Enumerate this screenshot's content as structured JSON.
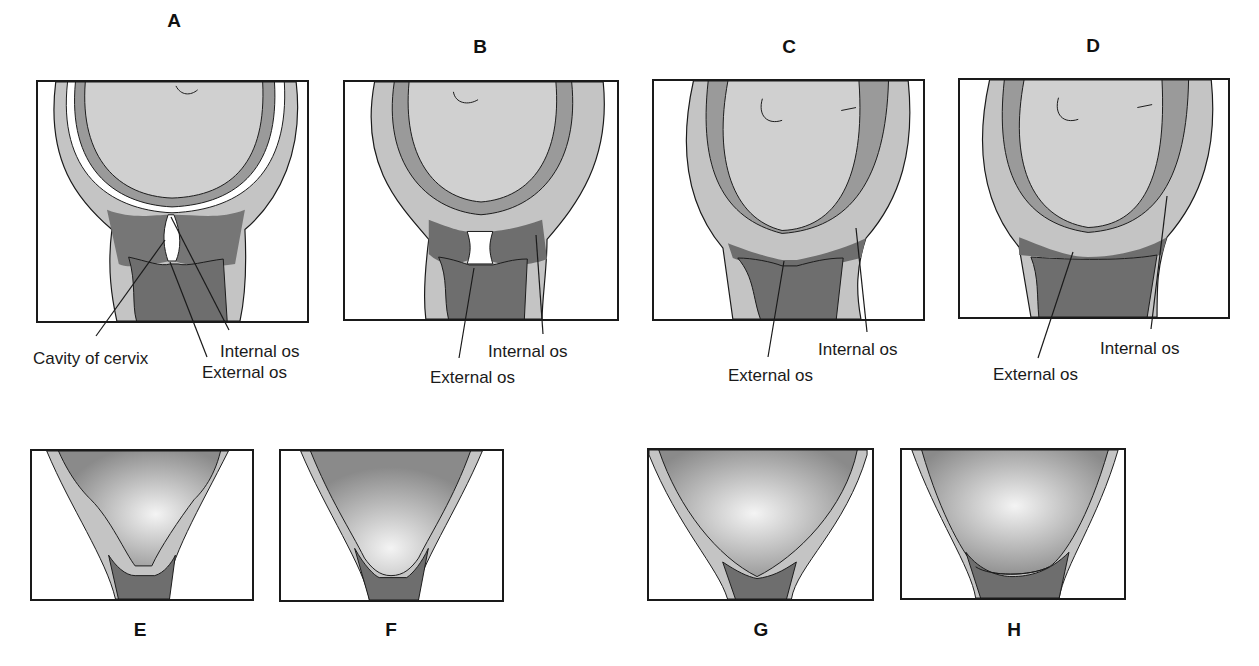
{
  "figure": {
    "top_row": [
      {
        "letter": "A",
        "labels": {
          "cavity": "Cavity of cervix",
          "internal_os": "Internal os",
          "external_os": "External os"
        }
      },
      {
        "letter": "B",
        "labels": {
          "internal_os": "Internal os",
          "external_os": "External os"
        }
      },
      {
        "letter": "C",
        "labels": {
          "internal_os": "Internal os",
          "external_os": "External os"
        }
      },
      {
        "letter": "D",
        "labels": {
          "internal_os": "Internal os",
          "external_os": "External os"
        }
      }
    ],
    "bottom_row": [
      {
        "letter": "E"
      },
      {
        "letter": "F"
      },
      {
        "letter": "G"
      },
      {
        "letter": "H"
      }
    ]
  },
  "colors": {
    "outline": "#1a1a1a",
    "fetal_head": "#cfcfcf",
    "uterine_wall": "#c4c4c4",
    "cervix_dark": "#6e6e6e",
    "vagina_dark": "#7a7a7a"
  }
}
